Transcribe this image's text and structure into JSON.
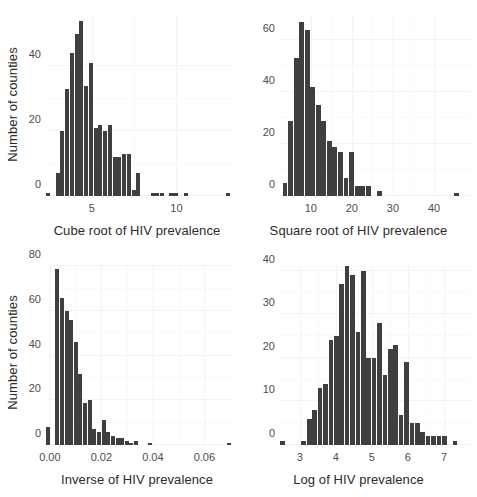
{
  "figure": {
    "layout": "2x2 panel grid of histograms",
    "background_color": "#ffffff",
    "bar_color": "#3f3f3f",
    "grid_color": "#f3f3f3"
  },
  "chart_data": [
    {
      "type": "bar",
      "panel": "top-left",
      "title": "",
      "xlabel": "Cube root of HIV prevalence",
      "ylabel": "Number of counties",
      "xlim": [
        2.3,
        13.4
      ],
      "ylim": [
        0,
        56
      ],
      "xticks": [
        5,
        10
      ],
      "xticklabels": [
        "5",
        "10"
      ],
      "yticks": [
        0,
        20,
        40
      ],
      "yticklabels": [
        "0",
        "20",
        "40"
      ],
      "grid": true,
      "bin_width": 0.28,
      "bin_centers": [
        2.45,
        2.73,
        3.01,
        3.29,
        3.57,
        3.85,
        4.13,
        4.41,
        4.69,
        4.97,
        5.25,
        5.53,
        5.81,
        6.09,
        6.37,
        6.65,
        6.93,
        7.21,
        7.49,
        7.77,
        8.05,
        8.33,
        8.61,
        8.89,
        9.17,
        9.45,
        9.73,
        10.01,
        10.29,
        10.57,
        10.85,
        11.13,
        11.41,
        11.69,
        11.97,
        12.25,
        12.53,
        12.81,
        13.09
      ],
      "values": [
        1,
        0,
        7,
        20,
        33,
        44,
        50,
        54,
        34,
        41,
        21,
        22,
        20,
        22,
        12,
        12,
        13,
        13,
        2,
        7,
        0,
        0,
        1,
        1,
        1,
        0,
        1,
        1,
        0,
        1,
        0,
        0,
        0,
        0,
        0,
        0,
        0,
        0,
        1
      ]
    },
    {
      "type": "bar",
      "panel": "top-right",
      "title": "",
      "xlabel": "Square root of HIV prevalence",
      "ylabel": "",
      "xlim": [
        2.5,
        49
      ],
      "ylim": [
        0,
        70
      ],
      "xticks": [
        10,
        20,
        30,
        40
      ],
      "xticklabels": [
        "10",
        "20",
        "30",
        "40"
      ],
      "yticks": [
        0,
        20,
        40,
        60
      ],
      "yticklabels": [
        "0",
        "20",
        "40",
        "60"
      ],
      "grid": true,
      "bin_width": 1.35,
      "bin_centers": [
        3.8,
        5.15,
        6.5,
        7.85,
        9.2,
        10.55,
        11.9,
        13.25,
        14.6,
        15.95,
        17.3,
        18.65,
        20.0,
        21.35,
        22.7,
        24.05,
        25.4,
        26.75,
        28.1,
        29.45,
        30.8,
        32.15,
        33.5,
        34.85,
        36.2,
        37.55,
        38.9,
        40.25,
        41.6,
        42.95,
        44.3,
        45.65,
        47.0,
        48.35
      ],
      "values": [
        5,
        29,
        53,
        67,
        64,
        42,
        35,
        29,
        21,
        19,
        17,
        7,
        17,
        4,
        4,
        4,
        0,
        2,
        0,
        0,
        0,
        0,
        0,
        0,
        0,
        0,
        0,
        0,
        0,
        0,
        0,
        1,
        0,
        0
      ]
    },
    {
      "type": "bar",
      "panel": "bottom-left",
      "title": "",
      "xlabel": "Inverse of HIV prevalence",
      "ylabel": "Number of counties",
      "xlim": [
        -0.0015,
        0.0715
      ],
      "ylim": [
        0,
        82
      ],
      "xticks": [
        0.0,
        0.02,
        0.04,
        0.06
      ],
      "xticklabels": [
        "0.00",
        "0.02",
        "0.04",
        "0.06"
      ],
      "yticks": [
        0,
        20,
        40,
        60,
        80
      ],
      "yticklabels": [
        "0",
        "20",
        "40",
        "60",
        "80"
      ],
      "grid": true,
      "bin_width": 0.0018,
      "bin_centers": [
        -0.0006,
        0.0012,
        0.003,
        0.0048,
        0.0066,
        0.0084,
        0.0102,
        0.012,
        0.0138,
        0.0156,
        0.0174,
        0.0192,
        0.021,
        0.0228,
        0.0246,
        0.0264,
        0.0282,
        0.03,
        0.0318,
        0.0336,
        0.0354,
        0.0372,
        0.039,
        0.0408,
        0.0426,
        0.0444,
        0.0462,
        0.048,
        0.0498,
        0.0516,
        0.0534,
        0.0552,
        0.057,
        0.0588,
        0.0606,
        0.0624,
        0.0642,
        0.066,
        0.0678,
        0.0696
      ],
      "values": [
        8,
        0,
        79,
        66,
        60,
        56,
        46,
        32,
        19,
        20,
        7,
        6,
        11,
        6,
        4,
        3,
        3,
        2,
        1,
        2,
        0,
        0,
        1,
        0,
        0,
        0,
        0,
        0,
        0,
        0,
        0,
        0,
        0,
        0,
        0,
        0,
        0,
        0,
        0,
        1
      ]
    },
    {
      "type": "bar",
      "panel": "bottom-right",
      "title": "",
      "xlabel": "Log of HIV prevalence",
      "ylabel": "",
      "xlim": [
        2.45,
        7.75
      ],
      "ylim": [
        0,
        42
      ],
      "xticks": [
        3,
        4,
        5,
        6,
        7
      ],
      "xticklabels": [
        "3",
        "4",
        "5",
        "6",
        "7"
      ],
      "yticks": [
        0,
        10,
        20,
        30,
        40
      ],
      "yticklabels": [
        "0",
        "10",
        "20",
        "30",
        "40"
      ],
      "grid": true,
      "bin_width": 0.148,
      "bin_centers": [
        2.52,
        2.67,
        2.82,
        2.97,
        3.12,
        3.27,
        3.42,
        3.57,
        3.72,
        3.87,
        4.02,
        4.17,
        4.32,
        4.47,
        4.62,
        4.77,
        4.92,
        5.07,
        5.22,
        5.37,
        5.52,
        5.67,
        5.82,
        5.97,
        6.12,
        6.27,
        6.42,
        6.57,
        6.72,
        6.87,
        7.02,
        7.17,
        7.32,
        7.47,
        7.62
      ],
      "values": [
        1,
        0,
        0,
        0,
        1,
        6,
        8,
        13,
        14,
        24,
        25,
        37,
        41,
        39,
        26,
        40,
        20,
        20,
        28,
        16,
        22,
        23,
        7,
        19,
        5,
        5,
        3,
        2,
        2,
        2,
        2,
        0,
        1,
        0,
        0
      ]
    }
  ]
}
